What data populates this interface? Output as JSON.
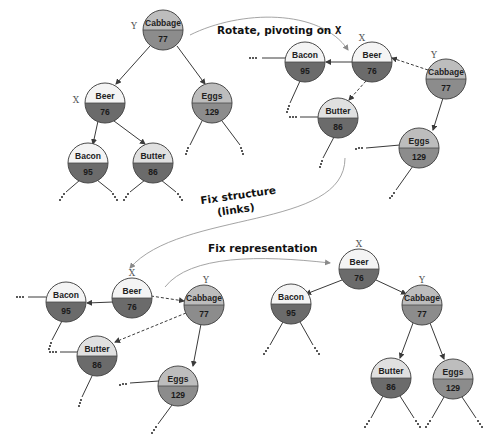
{
  "colors": {
    "node_top_light": "#f4f4f4",
    "node_top_gray": "#bdbdbd",
    "node_bottom_dark": "#6b6b6b",
    "node_bottom_mid": "#8c8c8c",
    "node_stroke": "#4a4a4a",
    "edge": "#3a3a3a",
    "curve": "#9a9a9a"
  },
  "captions": {
    "rotate_prefix": "Rotate, pivoting on ",
    "rotate_var": "X",
    "fix_structure_line1": "Fix structure",
    "fix_structure_line2": "(links)",
    "fix_representation": "Fix representation"
  },
  "diagrams": [
    {
      "id": "original",
      "nodes": [
        {
          "key": "cabbage",
          "label": "Cabbage",
          "value": "77",
          "var": "Y"
        },
        {
          "key": "beer",
          "label": "Beer",
          "value": "76",
          "var": "X"
        },
        {
          "key": "eggs",
          "label": "Eggs",
          "value": "129",
          "var": ""
        },
        {
          "key": "bacon",
          "label": "Bacon",
          "value": "95",
          "var": ""
        },
        {
          "key": "butter",
          "label": "Butter",
          "value": "86",
          "var": ""
        }
      ]
    },
    {
      "id": "rotating",
      "nodes": [
        {
          "key": "bacon",
          "label": "Bacon",
          "value": "95",
          "var": ""
        },
        {
          "key": "beer",
          "label": "Beer",
          "value": "76",
          "var": "X"
        },
        {
          "key": "cabbage",
          "label": "Cabbage",
          "value": "77",
          "var": "Y"
        },
        {
          "key": "butter",
          "label": "Butter",
          "value": "86",
          "var": ""
        },
        {
          "key": "eggs",
          "label": "Eggs",
          "value": "129",
          "var": ""
        }
      ]
    },
    {
      "id": "fixed-links",
      "nodes": [
        {
          "key": "bacon",
          "label": "Bacon",
          "value": "95",
          "var": ""
        },
        {
          "key": "beer",
          "label": "Beer",
          "value": "76",
          "var": "X"
        },
        {
          "key": "cabbage",
          "label": "Cabbage",
          "value": "77",
          "var": "Y"
        },
        {
          "key": "butter",
          "label": "Butter",
          "value": "86",
          "var": ""
        },
        {
          "key": "eggs",
          "label": "Eggs",
          "value": "129",
          "var": ""
        }
      ]
    },
    {
      "id": "final",
      "nodes": [
        {
          "key": "beer",
          "label": "Beer",
          "value": "76",
          "var": "X"
        },
        {
          "key": "bacon",
          "label": "Bacon",
          "value": "95",
          "var": ""
        },
        {
          "key": "cabbage",
          "label": "Cabbage",
          "value": "77",
          "var": "Y"
        },
        {
          "key": "butter",
          "label": "Butter",
          "value": "86",
          "var": ""
        },
        {
          "key": "eggs",
          "label": "Eggs",
          "value": "129",
          "var": ""
        }
      ]
    }
  ]
}
